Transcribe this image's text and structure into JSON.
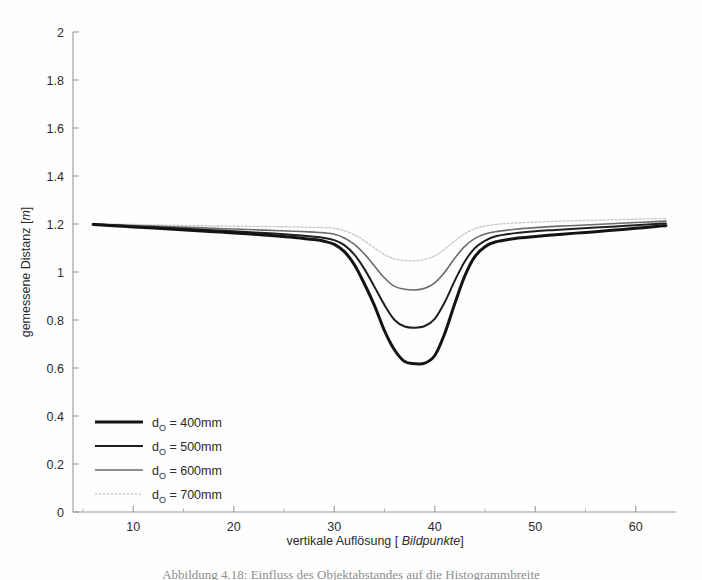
{
  "figure": {
    "background_color": "#fefefe",
    "caption_fragment": "Abbildung 4.18: Einfluss des Objektabstandes auf die Histogrammbreite"
  },
  "chart_data": {
    "type": "line",
    "title": "",
    "xlabel_prefix": "vertikale Auflösung [ ",
    "xlabel_italic": "Bildpunkte",
    "xlabel_suffix": "]",
    "ylabel_prefix": "gemessene Distanz [",
    "ylabel_italic": "m",
    "ylabel_suffix": "]",
    "xlim": [
      4,
      64
    ],
    "ylim": [
      0,
      2
    ],
    "xticks": [
      10,
      20,
      30,
      40,
      50,
      60
    ],
    "xtick_labels": [
      "10",
      "20",
      "30",
      "40",
      "50",
      "60"
    ],
    "xminorticks": [
      5,
      15,
      25,
      35,
      45,
      55
    ],
    "yticks": [
      0,
      0.2,
      0.4,
      0.6,
      0.8,
      1,
      1.2,
      1.4,
      1.6,
      1.8,
      2
    ],
    "ytick_labels": [
      "0",
      "0.2",
      "0.4",
      "0.6",
      "0.8",
      "1",
      "1.2",
      "1.4",
      "1.6",
      "1.8",
      "2"
    ],
    "grid": false,
    "legend_position": "lower-left",
    "x": [
      6,
      8,
      10,
      12,
      14,
      16,
      18,
      20,
      22,
      24,
      26,
      28,
      29,
      30,
      31,
      32,
      33,
      34,
      35,
      36,
      37,
      38,
      39,
      40,
      41,
      42,
      43,
      44,
      45,
      46,
      48,
      50,
      52,
      54,
      56,
      58,
      60,
      62,
      63
    ],
    "series": [
      {
        "name": "d_O = 400mm",
        "label_prefix": "d",
        "label_sub": "O",
        "label_suffix": " = 400mm",
        "color": "#141414",
        "width": 3.0,
        "dash": "none",
        "min_value": 0.62,
        "values": [
          1.198,
          1.193,
          1.188,
          1.183,
          1.178,
          1.173,
          1.168,
          1.163,
          1.157,
          1.151,
          1.144,
          1.135,
          1.128,
          1.115,
          1.085,
          1.03,
          0.95,
          0.86,
          0.755,
          0.675,
          0.627,
          0.618,
          0.62,
          0.652,
          0.745,
          0.87,
          0.985,
          1.065,
          1.105,
          1.125,
          1.14,
          1.148,
          1.155,
          1.162,
          1.168,
          1.175,
          1.182,
          1.19,
          1.193
        ]
      },
      {
        "name": "d_O = 500mm",
        "label_prefix": "d",
        "label_sub": "O",
        "label_suffix": " = 500mm",
        "color": "#1f1f1f",
        "width": 2.0,
        "dash": "none",
        "min_value": 0.77,
        "values": [
          1.199,
          1.194,
          1.19,
          1.186,
          1.182,
          1.178,
          1.174,
          1.17,
          1.165,
          1.16,
          1.154,
          1.147,
          1.142,
          1.133,
          1.112,
          1.072,
          1.012,
          0.938,
          0.862,
          0.8,
          0.773,
          0.768,
          0.775,
          0.805,
          0.875,
          0.965,
          1.045,
          1.1,
          1.13,
          1.148,
          1.162,
          1.17,
          1.175,
          1.18,
          1.185,
          1.19,
          1.195,
          1.2,
          1.202
        ]
      },
      {
        "name": "d_O = 600mm",
        "label_prefix": "d",
        "label_sub": "O",
        "label_suffix": " = 600mm",
        "color": "#6a6a6a",
        "width": 1.6,
        "dash": "none",
        "min_value": 0.93,
        "values": [
          1.2,
          1.197,
          1.194,
          1.191,
          1.188,
          1.185,
          1.182,
          1.179,
          1.176,
          1.173,
          1.17,
          1.166,
          1.163,
          1.157,
          1.142,
          1.115,
          1.075,
          1.025,
          0.975,
          0.94,
          0.928,
          0.925,
          0.932,
          0.955,
          1.0,
          1.058,
          1.108,
          1.14,
          1.158,
          1.168,
          1.178,
          1.185,
          1.19,
          1.194,
          1.198,
          1.202,
          1.206,
          1.21,
          1.212
        ]
      },
      {
        "name": "d_O = 700mm",
        "label_prefix": "d",
        "label_sub": "O",
        "label_suffix": " = 700mm",
        "color": "#c9c9c9",
        "width": 1.4,
        "dash": "2,2",
        "min_value": 1.05,
        "values": [
          1.202,
          1.2,
          1.198,
          1.196,
          1.195,
          1.193,
          1.192,
          1.191,
          1.19,
          1.189,
          1.188,
          1.186,
          1.185,
          1.182,
          1.172,
          1.155,
          1.13,
          1.1,
          1.072,
          1.055,
          1.048,
          1.047,
          1.052,
          1.068,
          1.095,
          1.13,
          1.16,
          1.18,
          1.192,
          1.198,
          1.204,
          1.208,
          1.211,
          1.214,
          1.216,
          1.218,
          1.22,
          1.222,
          1.223
        ]
      }
    ]
  },
  "legend": {
    "entries": [
      {
        "label_prefix": "d",
        "label_sub": "O",
        "label_suffix": " = 400mm"
      },
      {
        "label_prefix": "d",
        "label_sub": "O",
        "label_suffix": " = 500mm"
      },
      {
        "label_prefix": "d",
        "label_sub": "O",
        "label_suffix": " = 600mm"
      },
      {
        "label_prefix": "d",
        "label_sub": "O",
        "label_suffix": " = 700mm"
      }
    ]
  }
}
